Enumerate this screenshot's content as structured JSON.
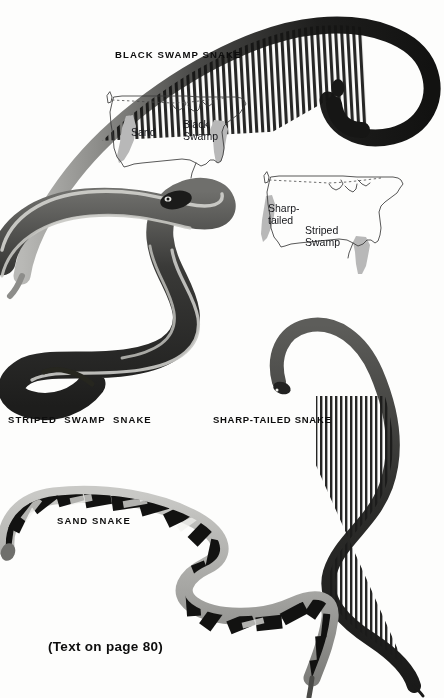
{
  "plate": {
    "background_color": "#fdfdfc",
    "ink_color": "#0d0d0d",
    "range_shade_color": "#b8b8b8",
    "map_outline_color": "#3a3a3a",
    "credit": "(Text on page 80)"
  },
  "captions": {
    "black_swamp": "BLACK SWAMP SNAKE",
    "striped_swamp": "STRIPED  SWAMP  SNAKE",
    "sharp_tailed": "SHARP-TAILED SNAKE",
    "sand": "SAND SNAKE"
  },
  "maps": [
    {
      "name": "upper-range-map",
      "labels": [
        {
          "name": "sand",
          "text": "Sand"
        },
        {
          "name": "black-swamp",
          "text": "Black\nSwamp"
        }
      ]
    },
    {
      "name": "lower-range-map",
      "labels": [
        {
          "name": "sharp-tailed",
          "text": "Sharp-\ntailed"
        },
        {
          "name": "striped-swamp",
          "text": "Striped\nSwamp"
        }
      ]
    }
  ],
  "specimens": [
    {
      "name": "black-swamp-snake",
      "pattern": "dark dorsum with pale ventral cross-bars"
    },
    {
      "name": "striped-swamp-snake",
      "pattern": "longitudinal light stripes on dark body"
    },
    {
      "name": "sharp-tailed-snake",
      "pattern": "dark dorsum with fine cross-barred underside"
    },
    {
      "name": "sand-snake",
      "pattern": "bold black bands on pale ground"
    }
  ]
}
